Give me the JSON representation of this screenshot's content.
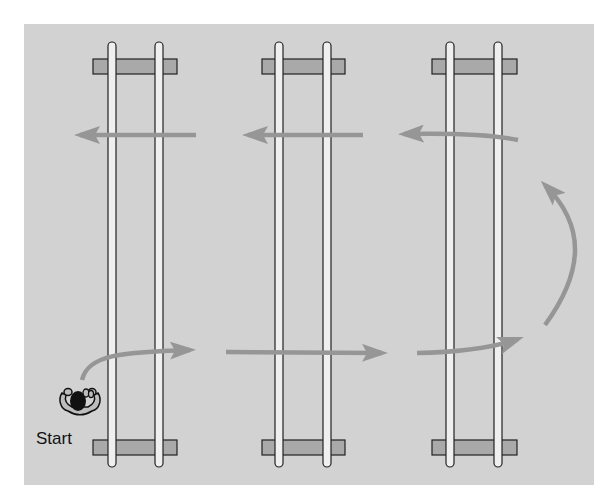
{
  "diagram": {
    "label_start": "Start",
    "colors": {
      "background": "#d2d2d2",
      "rail_fill": "#efefef",
      "rail_stroke": "#222222",
      "sleeper_fill": "#a9a9a9",
      "arrow": "#969696",
      "person": "#111111"
    },
    "tracks": [
      {
        "id": "track-1",
        "rails_x": [
          112,
          159
        ],
        "sleeper_x": [
          93,
          177
        ]
      },
      {
        "id": "track-2",
        "rails_x": [
          279,
          327
        ],
        "sleeper_x": [
          262,
          345
        ]
      },
      {
        "id": "track-3",
        "rails_x": [
          450,
          498
        ],
        "sleeper_x": [
          432,
          517
        ]
      }
    ],
    "path_description": "Start at lower left, cross tracks left-to-right along bottom, loop up on right side, return right-to-left along top"
  }
}
